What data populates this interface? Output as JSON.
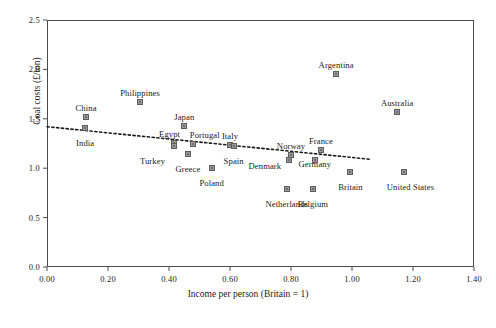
{
  "chart_data": {
    "type": "scatter",
    "title": "",
    "xlabel": "Income per person (Britain = 1)",
    "ylabel": "Coal costs (£/ton)",
    "xlim": [
      0.0,
      1.4
    ],
    "ylim": [
      0.0,
      2.5
    ],
    "xticks": [
      "0.00",
      "0.20",
      "0.40",
      "0.60",
      "0.80",
      "1.00",
      "1.20",
      "1.40"
    ],
    "xtick_values": [
      0.0,
      0.2,
      0.4,
      0.6,
      0.8,
      1.0,
      1.2,
      1.4
    ],
    "yticks": [
      "0.0",
      "0.5",
      "1.0",
      "1.5",
      "2.0",
      "2.5"
    ],
    "ytick_values": [
      0.0,
      0.5,
      1.0,
      1.5,
      2.0,
      2.5
    ],
    "grid": false,
    "legend": null,
    "marker_color": "#9a9a9a",
    "marker_edge_color": "#5d5d5d",
    "trendline_color": "#1a1a1a",
    "trendline_style": "dotted",
    "trendline": {
      "x_start": 0.0,
      "y_start": 1.42,
      "x_end": 1.06,
      "y_end": 1.09
    },
    "points": [
      {
        "name": "China",
        "x": 0.128,
        "y": 1.52,
        "label_dx": 0,
        "label_dy": -9
      },
      {
        "name": "India",
        "x": 0.125,
        "y": 1.41,
        "label_dx": 0,
        "label_dy": 15
      },
      {
        "name": "Philippines",
        "x": 0.305,
        "y": 1.67,
        "label_dx": 0,
        "label_dy": -9
      },
      {
        "name": "Egypt",
        "x": 0.415,
        "y": 1.26,
        "label_dx": -4,
        "label_dy": -9
      },
      {
        "name": "Turkey",
        "x": 0.418,
        "y": 1.22,
        "label_dx": -22,
        "label_dy": 15
      },
      {
        "name": "Japan",
        "x": 0.45,
        "y": 1.43,
        "label_dx": 0,
        "label_dy": -9
      },
      {
        "name": "Greece",
        "x": 0.462,
        "y": 1.14,
        "label_dx": 0,
        "label_dy": 15
      },
      {
        "name": "Portugal",
        "x": 0.478,
        "y": 1.25,
        "label_dx": 12,
        "label_dy": -9
      },
      {
        "name": "Poland",
        "x": 0.54,
        "y": 1.0,
        "label_dx": 0,
        "label_dy": 15
      },
      {
        "name": "Italy",
        "x": 0.6,
        "y": 1.23,
        "label_dx": 0,
        "label_dy": -9
      },
      {
        "name": "Spain",
        "x": 0.612,
        "y": 1.22,
        "label_dx": 0,
        "label_dy": 15
      },
      {
        "name": "Norway",
        "x": 0.8,
        "y": 1.13,
        "label_dx": 0,
        "label_dy": -9
      },
      {
        "name": "Denmark",
        "x": 0.793,
        "y": 1.08,
        "label_dx": -24,
        "label_dy": 6
      },
      {
        "name": "Netherlands",
        "x": 0.786,
        "y": 0.79,
        "label_dx": 0,
        "label_dy": 15
      },
      {
        "name": "France",
        "x": 0.898,
        "y": 1.18,
        "label_dx": 0,
        "label_dy": -9
      },
      {
        "name": "Germany",
        "x": 0.878,
        "y": 1.08,
        "label_dx": 0,
        "label_dy": 4
      },
      {
        "name": "Belgium",
        "x": 0.872,
        "y": 0.79,
        "label_dx": 0,
        "label_dy": 15
      },
      {
        "name": "Argentina",
        "x": 0.948,
        "y": 1.95,
        "label_dx": 0,
        "label_dy": -9
      },
      {
        "name": "Britain",
        "x": 0.995,
        "y": 0.96,
        "label_dx": 0,
        "label_dy": 15
      },
      {
        "name": "Australia",
        "x": 1.148,
        "y": 1.57,
        "label_dx": 0,
        "label_dy": -9
      },
      {
        "name": "United States",
        "x": 1.172,
        "y": 0.96,
        "label_dx": 6,
        "label_dy": 15
      }
    ]
  }
}
